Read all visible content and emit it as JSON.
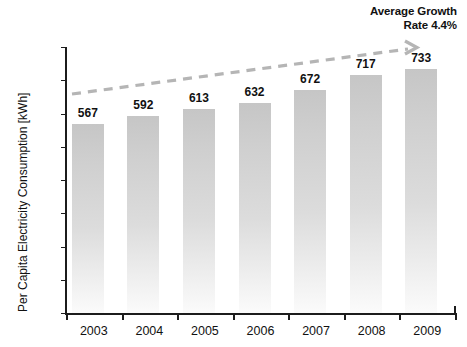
{
  "chart_data": {
    "type": "bar",
    "title": "",
    "categories": [
      "2003",
      "2004",
      "2005",
      "2006",
      "2007",
      "2008",
      "2009"
    ],
    "values": [
      567,
      592,
      613,
      632,
      672,
      717,
      733
    ],
    "series": [
      {
        "name": "Per Capita Electricity Consumption",
        "values": [
          567,
          592,
          613,
          632,
          672,
          717,
          733
        ]
      }
    ],
    "xlabel": "",
    "ylabel": "Per Capita Electricity Consumption [kWh]",
    "ylim": [
      0,
      800
    ],
    "yticks": [
      0,
      100,
      200,
      300,
      400,
      500,
      600,
      700,
      800
    ],
    "ytick_labels": [
      "0",
      "100",
      "200",
      "300",
      "400",
      "500",
      "600",
      "700",
      "800"
    ],
    "grid": false,
    "legend": false,
    "bar_color": "#cfcfcf",
    "axis_color": "#1c1c1c",
    "trend_color": "#b5b5b5",
    "annotation": {
      "line1": "Average Growth",
      "line2": "Rate 4.4%",
      "value": "4.4%",
      "type": "trend-arrow"
    }
  },
  "axis": {
    "y_title": "Per Capita Electricity Consumption [kWh]"
  }
}
